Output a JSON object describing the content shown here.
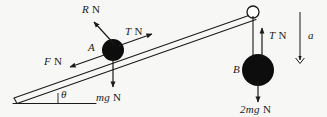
{
  "figure": {
    "type": "free-body-diagram",
    "background_color": "#f7f7f5",
    "ink_color": "#1a1a1a",
    "body_fill_color": "#0d0d0d"
  },
  "labels": {
    "normal_force": {
      "symbol": "R",
      "unit": "N",
      "text": "R N"
    },
    "tension_incline": {
      "symbol": "T",
      "unit": "N",
      "text": "T N"
    },
    "friction_force": {
      "symbol": "F",
      "unit": "N",
      "text": "F N"
    },
    "weight_a": {
      "symbol": "mg",
      "unit": "N",
      "text": "mg N"
    },
    "tension_hanging": {
      "symbol": "T",
      "unit": "N",
      "text": "T N"
    },
    "weight_b": {
      "symbol": "2mg",
      "unit": "N",
      "text": "2mg N"
    },
    "body_a": "A",
    "body_b": "B",
    "angle": "θ",
    "acceleration": "a"
  },
  "bodies": [
    {
      "name": "A",
      "label": "A",
      "shape": "filled-circle",
      "radius_px": 11,
      "cx": 113,
      "cy": 50,
      "location": "on-incline"
    },
    {
      "name": "B",
      "label": "B",
      "shape": "filled-circle",
      "radius_px": 16,
      "cx": 258,
      "cy": 70,
      "location": "hanging"
    }
  ],
  "pulley": {
    "shape": "open-circle",
    "radius_px": 6,
    "cx": 253,
    "cy": 12,
    "fill": "#ffffff"
  },
  "incline": {
    "description": "double-line plank rising from lower-left to pulley at upper-right",
    "base_x1": 14,
    "base_y1": 98,
    "base_x2": 253,
    "base_y2": 14,
    "horizontal_x1": 14,
    "horizontal_y1": 98,
    "horizontal_x2": 96,
    "horizontal_y2": 98
  },
  "vectors": [
    {
      "name": "normal-force",
      "label": "R N",
      "from": [
        113,
        46
      ],
      "to": [
        92,
        22
      ],
      "style": "solid-arrow"
    },
    {
      "name": "tension-on-a",
      "label": "T N",
      "from": [
        120,
        46
      ],
      "to": [
        152,
        35
      ],
      "style": "solid-arrow"
    },
    {
      "name": "friction-on-a",
      "label": "F N",
      "from": [
        106,
        54
      ],
      "to": [
        70,
        67
      ],
      "style": "solid-arrow"
    },
    {
      "name": "weight-of-a",
      "label": "mg N",
      "from": [
        113,
        57
      ],
      "to": [
        113,
        88
      ],
      "style": "solid-arrow"
    },
    {
      "name": "tension-on-b",
      "label": "T N",
      "from": [
        262,
        56
      ],
      "to": [
        262,
        28
      ],
      "style": "solid-arrow"
    },
    {
      "name": "weight-of-b",
      "label": "2mg N",
      "from": [
        258,
        82
      ],
      "to": [
        258,
        103
      ],
      "style": "solid-arrow"
    },
    {
      "name": "acceleration",
      "label": "a",
      "from": [
        300,
        12
      ],
      "to": [
        300,
        64
      ],
      "style": "double-chevron-arrow"
    }
  ],
  "string": {
    "from": [
      253,
      12
    ],
    "to": [
      253,
      56
    ],
    "description": "inextensible string from pulley down to body B"
  }
}
